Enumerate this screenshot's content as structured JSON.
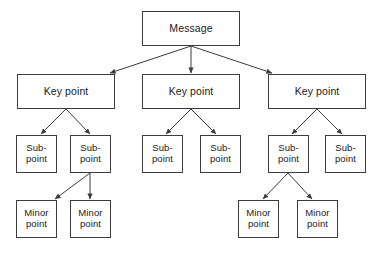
{
  "diagram": {
    "type": "tree",
    "background_color": "#ffffff",
    "box_border_color": "#3c3c3c",
    "box_fill_color": "#ffffff",
    "connector_color": "#3c3c3c",
    "text_color": "#1a1a1a",
    "nodes": [
      {
        "id": "message",
        "label": "Message",
        "level": "message",
        "x": 142,
        "y": 11,
        "w": 98,
        "h": 35
      },
      {
        "id": "key1",
        "label": "Key point",
        "level": "key",
        "x": 17,
        "y": 74,
        "w": 98,
        "h": 35
      },
      {
        "id": "key2",
        "label": "Key point",
        "level": "key",
        "x": 142,
        "y": 74,
        "w": 98,
        "h": 35
      },
      {
        "id": "key3",
        "label": "Key point",
        "level": "key",
        "x": 268,
        "y": 74,
        "w": 98,
        "h": 35
      },
      {
        "id": "sub1",
        "label": "Sub-\npoint",
        "level": "sub",
        "x": 16,
        "y": 135,
        "w": 41,
        "h": 38
      },
      {
        "id": "sub2",
        "label": "Sub-\npoint",
        "level": "sub",
        "x": 70,
        "y": 135,
        "w": 41,
        "h": 38
      },
      {
        "id": "sub3",
        "label": "Sub-\npoint",
        "level": "sub",
        "x": 142,
        "y": 135,
        "w": 41,
        "h": 38
      },
      {
        "id": "sub4",
        "label": "Sub-\npoint",
        "level": "sub",
        "x": 200,
        "y": 135,
        "w": 41,
        "h": 38
      },
      {
        "id": "sub5",
        "label": "Sub-\npoint",
        "level": "sub",
        "x": 268,
        "y": 135,
        "w": 41,
        "h": 38
      },
      {
        "id": "sub6",
        "label": "Sub-\npoint",
        "level": "sub",
        "x": 325,
        "y": 135,
        "w": 41,
        "h": 38
      },
      {
        "id": "minor1",
        "label": "Minor\npoint",
        "level": "minor",
        "x": 16,
        "y": 200,
        "w": 41,
        "h": 38
      },
      {
        "id": "minor2",
        "label": "Minor\npoint",
        "level": "minor",
        "x": 70,
        "y": 200,
        "w": 41,
        "h": 38
      },
      {
        "id": "minor3",
        "label": "Minor\npoint",
        "level": "minor",
        "x": 238,
        "y": 200,
        "w": 41,
        "h": 38
      },
      {
        "id": "minor4",
        "label": "Minor\npoint",
        "level": "minor",
        "x": 297,
        "y": 200,
        "w": 41,
        "h": 38
      }
    ],
    "edges": [
      {
        "id": "edge-message-key1",
        "from": "message",
        "to": "key1",
        "x1": 191,
        "y1": 46,
        "x2": 110,
        "y2": 73
      },
      {
        "id": "edge-message-key2",
        "from": "message",
        "to": "key2",
        "x1": 191,
        "y1": 46,
        "x2": 191,
        "y2": 73
      },
      {
        "id": "edge-message-key3",
        "from": "message",
        "to": "key3",
        "x1": 191,
        "y1": 46,
        "x2": 272,
        "y2": 73
      },
      {
        "id": "edge-key1-sub1",
        "from": "key1",
        "to": "sub1",
        "x1": 66,
        "y1": 109,
        "x2": 41,
        "y2": 134
      },
      {
        "id": "edge-key1-sub2",
        "from": "key1",
        "to": "sub2",
        "x1": 66,
        "y1": 109,
        "x2": 90,
        "y2": 134
      },
      {
        "id": "edge-key2-sub3",
        "from": "key2",
        "to": "sub3",
        "x1": 191,
        "y1": 109,
        "x2": 166,
        "y2": 134
      },
      {
        "id": "edge-key2-sub4",
        "from": "key2",
        "to": "sub4",
        "x1": 191,
        "y1": 109,
        "x2": 216,
        "y2": 134
      },
      {
        "id": "edge-key3-sub5",
        "from": "key3",
        "to": "sub5",
        "x1": 317,
        "y1": 109,
        "x2": 292,
        "y2": 134
      },
      {
        "id": "edge-key3-sub6",
        "from": "key3",
        "to": "sub6",
        "x1": 317,
        "y1": 109,
        "x2": 342,
        "y2": 134
      },
      {
        "id": "edge-sub2-minor1",
        "from": "sub2",
        "to": "minor1",
        "x1": 90,
        "y1": 173,
        "x2": 55,
        "y2": 199
      },
      {
        "id": "edge-sub2-minor2",
        "from": "sub2",
        "to": "minor2",
        "x1": 90,
        "y1": 173,
        "x2": 90,
        "y2": 199
      },
      {
        "id": "edge-sub5-minor3",
        "from": "sub5",
        "to": "minor3",
        "x1": 288,
        "y1": 173,
        "x2": 263,
        "y2": 199
      },
      {
        "id": "edge-sub5-minor4",
        "from": "sub5",
        "to": "minor4",
        "x1": 288,
        "y1": 173,
        "x2": 312,
        "y2": 199
      }
    ]
  }
}
